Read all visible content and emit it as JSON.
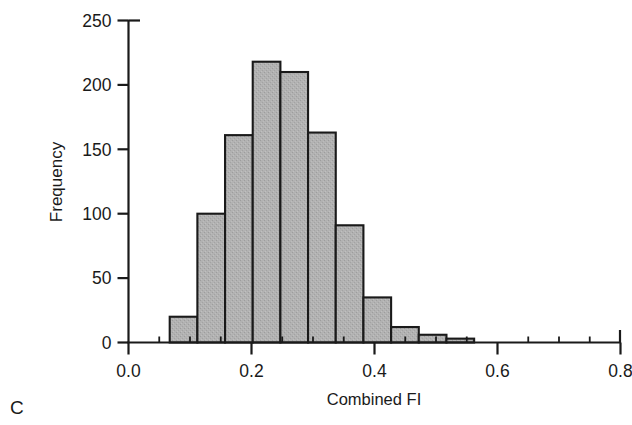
{
  "panel": {
    "label": "C"
  },
  "chart_data": {
    "type": "bar",
    "title": "",
    "subtitle": "",
    "xlabel": "Combined FI",
    "ylabel": "Frequency",
    "xlim": [
      0.0,
      0.8
    ],
    "ylim": [
      0,
      250
    ],
    "grid": false,
    "legend": null,
    "bin_width": 0.045,
    "bar_fill_color": "#adadad",
    "bar_edge_color": "#1a1a1a",
    "axis_color": "#1a1a1a",
    "xticks": [
      0.0,
      0.2,
      0.4,
      0.6,
      0.8
    ],
    "xtick_labels": [
      "0.0",
      "0.2",
      "0.4",
      "0.6",
      "0.8"
    ],
    "yticks": [
      0,
      50,
      100,
      150,
      200,
      250
    ],
    "ytick_labels": [
      "0",
      "50",
      "100",
      "150",
      "200",
      "250"
    ],
    "x_minor_tick_step": 0.05,
    "bins": [
      {
        "left": 0.067,
        "right": 0.112,
        "value": 20
      },
      {
        "left": 0.112,
        "right": 0.157,
        "value": 100
      },
      {
        "left": 0.157,
        "right": 0.202,
        "value": 161
      },
      {
        "left": 0.202,
        "right": 0.247,
        "value": 218
      },
      {
        "left": 0.247,
        "right": 0.292,
        "value": 210
      },
      {
        "left": 0.292,
        "right": 0.337,
        "value": 163
      },
      {
        "left": 0.337,
        "right": 0.382,
        "value": 91
      },
      {
        "left": 0.382,
        "right": 0.427,
        "value": 35
      },
      {
        "left": 0.427,
        "right": 0.472,
        "value": 12
      },
      {
        "left": 0.472,
        "right": 0.517,
        "value": 6
      },
      {
        "left": 0.517,
        "right": 0.562,
        "value": 3
      }
    ],
    "categories": [
      "0.07-0.11",
      "0.11-0.16",
      "0.16-0.20",
      "0.20-0.25",
      "0.25-0.29",
      "0.29-0.34",
      "0.34-0.38",
      "0.38-0.43",
      "0.43-0.47",
      "0.47-0.52",
      "0.52-0.56"
    ],
    "values": [
      20,
      100,
      161,
      218,
      210,
      163,
      91,
      35,
      12,
      6,
      3
    ]
  }
}
